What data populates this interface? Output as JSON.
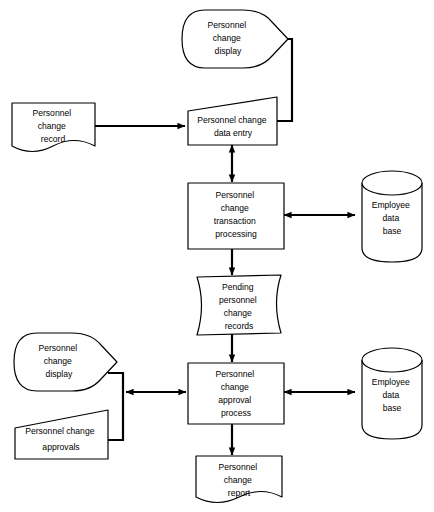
{
  "diagram": {
    "background_color": "#ffffff",
    "line_color": "#000000",
    "nodes": {
      "display_top": {
        "shape": "display",
        "lines": [
          "Personnel",
          "change",
          "display"
        ]
      },
      "record_input": {
        "shape": "document",
        "lines": [
          "Personnel",
          "change",
          "record"
        ]
      },
      "data_entry": {
        "shape": "manual-input",
        "lines": [
          "Personnel change",
          "data entry"
        ]
      },
      "transaction_processing": {
        "shape": "process",
        "lines": [
          "Personnel",
          "change",
          "transaction",
          "processing"
        ]
      },
      "employee_db_top": {
        "shape": "database",
        "lines": [
          "Employee",
          "data",
          "base"
        ]
      },
      "pending_records": {
        "shape": "stored-data",
        "lines": [
          "Pending",
          "personnel",
          "change",
          "records"
        ]
      },
      "display_bottom": {
        "shape": "display",
        "lines": [
          "Personnel",
          "change",
          "display"
        ]
      },
      "approvals_input": {
        "shape": "manual-input",
        "lines": [
          "Personnel change",
          "approvals"
        ]
      },
      "approval_process": {
        "shape": "process",
        "lines": [
          "Personnel",
          "change",
          "approval",
          "process"
        ]
      },
      "employee_db_bottom": {
        "shape": "database",
        "lines": [
          "Employee",
          "data",
          "base"
        ]
      },
      "change_report": {
        "shape": "document",
        "lines": [
          "Personnel",
          "change",
          "report"
        ]
      }
    },
    "connectors": [
      {
        "name": "record-to-data-entry",
        "direction": "one-way"
      },
      {
        "name": "data-entry-to-display-top",
        "direction": "one-way"
      },
      {
        "name": "data-entry-to-transaction-processing",
        "direction": "two-way"
      },
      {
        "name": "transaction-processing-to-employee-db-top",
        "direction": "two-way"
      },
      {
        "name": "transaction-processing-to-pending-records",
        "direction": "one-way"
      },
      {
        "name": "pending-records-to-approval-process",
        "direction": "one-way"
      },
      {
        "name": "approval-process-to-left-bracket",
        "direction": "two-way"
      },
      {
        "name": "approval-process-to-employee-db-bottom",
        "direction": "two-way"
      },
      {
        "name": "approval-process-to-change-report",
        "direction": "one-way"
      }
    ]
  }
}
